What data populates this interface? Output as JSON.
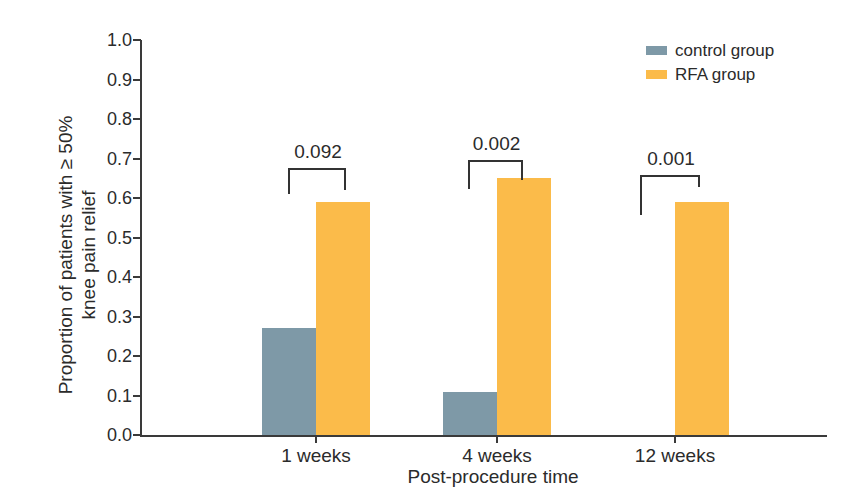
{
  "chart_data": {
    "type": "bar",
    "title": "",
    "categories": [
      "1 weeks",
      "4 weeks",
      "12 weeks"
    ],
    "series": [
      {
        "name": "control group",
        "color": "#7e99a7",
        "values": [
          0.27,
          0.11,
          0.0
        ]
      },
      {
        "name": "RFA group",
        "color": "#fbbb4a",
        "values": [
          0.59,
          0.65,
          0.59
        ]
      }
    ],
    "p_values": [
      "0.092",
      "0.002",
      "0.001"
    ],
    "xlabel": "Post-procedure time",
    "ylabel_line1": "Proportion of patients with  ≥ 50%",
    "ylabel_line2": "knee pain relief",
    "ylim": [
      0.0,
      1.0
    ],
    "ytick_step": 0.1,
    "yticks": [
      "1.0",
      "0.9",
      "0.8",
      "0.7",
      "0.6",
      "0.5",
      "0.4",
      "0.3",
      "0.2",
      "0.1",
      "0.0"
    ],
    "grid": false,
    "legend_position": "top-right",
    "axis_color": "#3a3a3a",
    "text_color": "#2b2b2b"
  }
}
